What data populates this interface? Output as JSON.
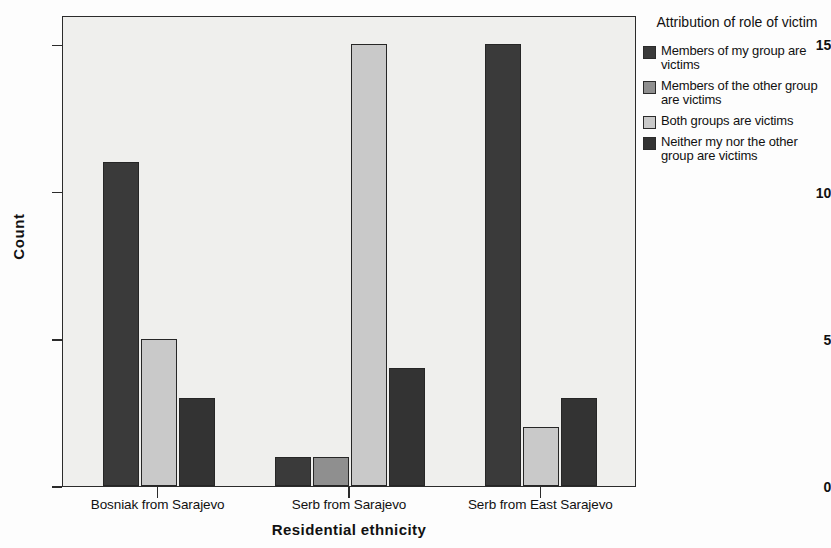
{
  "chart_data": {
    "type": "bar",
    "title": "",
    "xlabel": "Residential ethnicity",
    "ylabel": "Count",
    "ylim": [
      0,
      16
    ],
    "yticks": [
      0,
      5,
      10,
      15
    ],
    "ytick_labels": [
      "0",
      "5",
      "10",
      "15"
    ],
    "grid": false,
    "legend_position": "right",
    "legend_title": "Attribution of role of victim",
    "categories": [
      "Bosniak from Sarajevo",
      "Serb from Sarajevo",
      "Serb from East Sarajevo"
    ],
    "series": [
      {
        "name": "Members of my group are victims",
        "color": "#3a3a3a",
        "values": [
          11,
          1,
          15
        ]
      },
      {
        "name": "Members of the other group are victims",
        "color": "#8f8f8f",
        "values": [
          0,
          1,
          0
        ]
      },
      {
        "name": "Both groups are victims",
        "color": "#c9c9c9",
        "values": [
          5,
          15,
          2
        ]
      },
      {
        "name": "Neither my nor the other group are victims",
        "color": "#333333",
        "values": [
          3,
          4,
          3
        ]
      }
    ]
  },
  "legend": {
    "title": "Attribution of role of victim",
    "items": [
      {
        "label": "Members of my group are victims",
        "color": "#3a3a3a",
        "swatch_name": "legend-swatch-my-group"
      },
      {
        "label": "Members of the other group are victims",
        "color": "#8f8f8f",
        "swatch_name": "legend-swatch-other-group"
      },
      {
        "label": "Both groups are victims",
        "color": "#c9c9c9",
        "swatch_name": "legend-swatch-both-groups"
      },
      {
        "label": "Neither my nor the other group are victims",
        "color": "#333333",
        "swatch_name": "legend-swatch-neither-group"
      }
    ]
  },
  "axes": {
    "y_title": "Count",
    "x_title": "Residential ethnicity",
    "y_tick_labels": [
      "0",
      "5",
      "10",
      "15"
    ],
    "x_tick_labels": [
      "Bosniak from Sarajevo",
      "Serb from Sarajevo",
      "Serb from East Sarajevo"
    ]
  },
  "colors": {
    "plot_background": "#efefed",
    "page_background": "#fdfdfd",
    "axis": "#2b2b2b",
    "text": "#111111"
  }
}
